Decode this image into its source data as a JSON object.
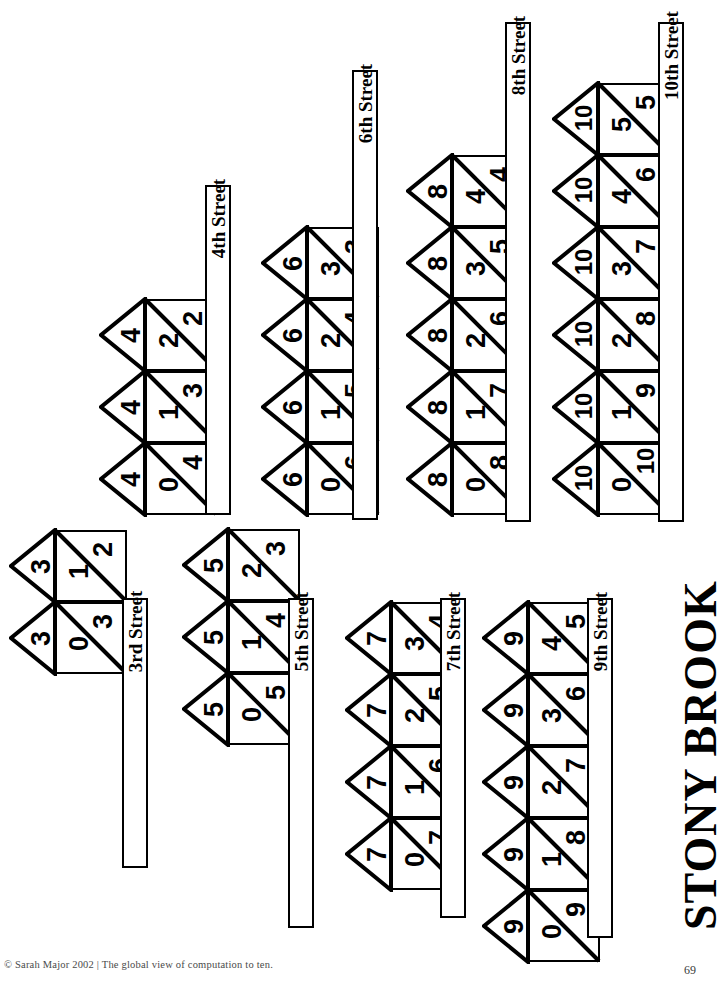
{
  "document": {
    "title": "STONY BROOK",
    "footer_credit": "© Sarah Major 2002 | The global view of computation to ten.",
    "page_number": "69"
  },
  "streets": [
    {
      "label": "3rd Street"
    },
    {
      "label": "4th Street"
    },
    {
      "label": "5th Street"
    },
    {
      "label": "6th Street"
    },
    {
      "label": "7th Street"
    },
    {
      "label": "8th Street"
    },
    {
      "label": "9th Street"
    },
    {
      "label": "10th Street"
    }
  ],
  "number_bonds": [
    {
      "street": "3rd Street",
      "total": "3",
      "pairs": [
        {
          "a": "0",
          "b": "3"
        },
        {
          "a": "1",
          "b": "2"
        }
      ]
    },
    {
      "street": "4th Street",
      "total": "4",
      "pairs": [
        {
          "a": "0",
          "b": "4"
        },
        {
          "a": "1",
          "b": "3"
        },
        {
          "a": "2",
          "b": "2"
        }
      ]
    },
    {
      "street": "5th Street",
      "total": "5",
      "pairs": [
        {
          "a": "0",
          "b": "5"
        },
        {
          "a": "1",
          "b": "4"
        },
        {
          "a": "2",
          "b": "3"
        }
      ]
    },
    {
      "street": "6th Street",
      "total": "6",
      "pairs": [
        {
          "a": "0",
          "b": "6"
        },
        {
          "a": "1",
          "b": "5"
        },
        {
          "a": "2",
          "b": "4"
        },
        {
          "a": "3",
          "b": "3"
        }
      ]
    },
    {
      "street": "7th Street",
      "total": "7",
      "pairs": [
        {
          "a": "0",
          "b": "7"
        },
        {
          "a": "1",
          "b": "6"
        },
        {
          "a": "2",
          "b": "5"
        },
        {
          "a": "3",
          "b": "4"
        }
      ]
    },
    {
      "street": "8th Street",
      "total": "8",
      "pairs": [
        {
          "a": "0",
          "b": "8"
        },
        {
          "a": "1",
          "b": "7"
        },
        {
          "a": "2",
          "b": "6"
        },
        {
          "a": "3",
          "b": "5"
        },
        {
          "a": "4",
          "b": "4"
        }
      ]
    },
    {
      "street": "9th Street",
      "total": "9",
      "pairs": [
        {
          "a": "0",
          "b": "9"
        },
        {
          "a": "1",
          "b": "8"
        },
        {
          "a": "2",
          "b": "7"
        },
        {
          "a": "3",
          "b": "6"
        },
        {
          "a": "4",
          "b": "5"
        }
      ]
    },
    {
      "street": "10th Street",
      "total": "10",
      "pairs": [
        {
          "a": "0",
          "b": "10"
        },
        {
          "a": "1",
          "b": "9"
        },
        {
          "a": "2",
          "b": "8"
        },
        {
          "a": "3",
          "b": "7"
        },
        {
          "a": "4",
          "b": "6"
        },
        {
          "a": "5",
          "b": "5"
        }
      ]
    }
  ],
  "colors": {
    "ink": "#000000",
    "paper": "#ffffff",
    "footer_text": "#4a4a4a"
  }
}
